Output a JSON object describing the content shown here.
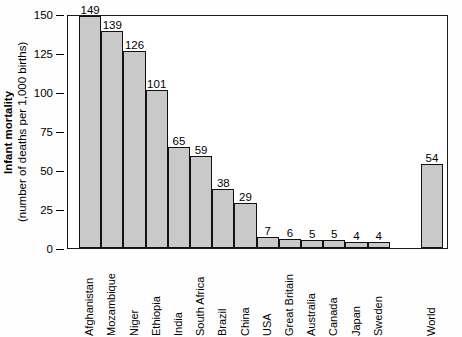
{
  "chart_data": {
    "type": "bar",
    "title": "",
    "xlabel": "",
    "ylabel_main": "Infant mortality",
    "ylabel_sub": "(number of deaths per 1,000 births)",
    "ylim": [
      0,
      150
    ],
    "yticks": [
      150,
      125,
      100,
      75,
      50,
      25,
      0
    ],
    "ytick_labels": [
      "150",
      "125",
      "100",
      "75",
      "50",
      "25",
      "0"
    ],
    "grid": false,
    "legend": null,
    "bar_color": "#c9c9c9",
    "bar_edge_color": "#111111",
    "categories": [
      "Afghanistan",
      "Mozambique",
      "Niger",
      "Ethiopia",
      "India",
      "South Africa",
      "Brazil",
      "China",
      "USA",
      "Great Britain",
      "Australia",
      "Canada",
      "Japan",
      "Sweden",
      "World"
    ],
    "values": [
      149,
      139,
      126,
      101,
      65,
      59,
      38,
      29,
      7,
      6,
      5,
      5,
      4,
      4,
      54
    ],
    "value_labels": [
      "149",
      "139",
      "126",
      "101",
      "65",
      "59",
      "38",
      "29",
      "7",
      "6",
      "5",
      "5",
      "4",
      "4",
      "54"
    ]
  }
}
